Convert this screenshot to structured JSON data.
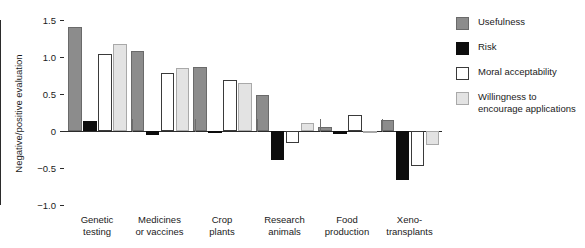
{
  "chart_data": {
    "type": "bar",
    "title": "",
    "xlabel": "",
    "ylabel": "Negative/positive evaluation",
    "ylim": [
      -1.0,
      1.5
    ],
    "yticks": [
      1.5,
      1.0,
      0.5,
      0,
      -0.5,
      -1.0
    ],
    "ytick_labels": [
      "1.5",
      "1.0",
      "0.5",
      "0",
      "−0.5",
      "−1.0"
    ],
    "grid": false,
    "legend_position": "right",
    "categories": [
      "Genetic\ntesting",
      "Medicines\nor vaccines",
      "Crop\nplants",
      "Research\nanimals",
      "Food\nproduction",
      "Xeno-\ntransplants"
    ],
    "series": [
      {
        "name": "Usefulness",
        "color": "#8c8c8c",
        "values": [
          1.4,
          1.08,
          0.87,
          0.49,
          0.06,
          0.15
        ]
      },
      {
        "name": "Risk",
        "color": "#0d0d0d",
        "values": [
          0.14,
          -0.05,
          -0.01,
          -0.39,
          -0.04,
          -0.66
        ]
      },
      {
        "name": "Moral acceptability",
        "color": "#ffffff",
        "values": [
          1.04,
          0.78,
          0.69,
          -0.16,
          0.22,
          -0.47
        ]
      },
      {
        "name": "Willingness to\nencourage applications",
        "color": "#e3e3e3",
        "values": [
          1.18,
          0.85,
          0.65,
          0.11,
          -0.02,
          -0.19
        ]
      }
    ]
  },
  "legend": {
    "items": [
      {
        "label": "Usefulness"
      },
      {
        "label": "Risk"
      },
      {
        "label": "Moral acceptability"
      },
      {
        "label": "Willingness to\nencourage applications"
      }
    ]
  }
}
